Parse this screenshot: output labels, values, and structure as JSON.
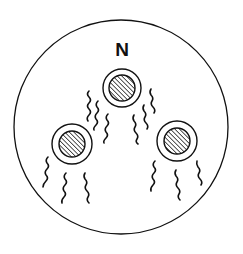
{
  "diagram": {
    "label": "N",
    "colors": {
      "stroke": "#111111",
      "background": "#ffffff"
    },
    "container": {
      "shape": "circle",
      "cx": 121,
      "cy": 127,
      "r": 107
    },
    "cells": [
      {
        "id": "top",
        "cx": 122,
        "cy": 88,
        "outer_r": 19,
        "inner_r": 13,
        "inner_fill": "hatched"
      },
      {
        "id": "left",
        "cx": 72,
        "cy": 144,
        "outer_r": 20,
        "inner_r": 13,
        "inner_fill": "hatched"
      },
      {
        "id": "right",
        "cx": 177,
        "cy": 141,
        "outer_r": 20,
        "inner_r": 13,
        "inner_fill": "hatched"
      }
    ],
    "flagella_per_cell": 4,
    "flagella_style": "wavy"
  }
}
